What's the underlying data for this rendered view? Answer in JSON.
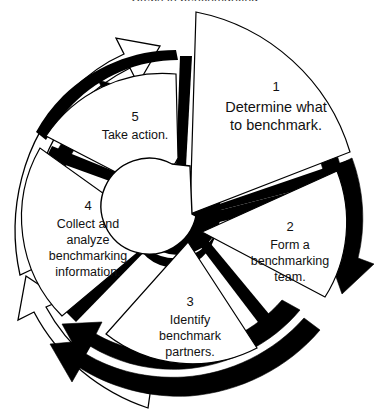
{
  "figure": {
    "kind": "process-cycle-wheel",
    "clipped_top_caption": "Steps in benchmarking",
    "background_color": "#ffffff",
    "ink_color": "#000000",
    "text_color": "#111111",
    "rotation_direction": "counterclockwise",
    "segment_count": 5
  },
  "segments": [
    {
      "number": "1",
      "lines": [
        "Determine what",
        "to benchmark."
      ],
      "emphasis": "large",
      "position": "top-right",
      "exploded": true
    },
    {
      "number": "2",
      "lines": [
        "Form a",
        "benchmarking",
        "team."
      ],
      "emphasis": "normal",
      "position": "right",
      "exploded": false
    },
    {
      "number": "3",
      "lines": [
        "Identify",
        "benchmark",
        "partners."
      ],
      "emphasis": "normal",
      "position": "bottom",
      "exploded": false
    },
    {
      "number": "4",
      "lines": [
        "Collect and",
        "analyze",
        "benchmarking",
        "information."
      ],
      "emphasis": "normal",
      "position": "left",
      "exploded": false
    },
    {
      "number": "5",
      "lines": [
        "Take action."
      ],
      "emphasis": "normal",
      "position": "top-left",
      "exploded": false
    }
  ],
  "arrows": [
    {
      "id": "outer-left-arrow",
      "style": "outline",
      "direction": "counterclockwise",
      "location": "upper-left"
    },
    {
      "id": "outer-bottom-arrow",
      "style": "outline",
      "direction": "counterclockwise",
      "location": "lower-left"
    },
    {
      "id": "solid-left-arrow",
      "style": "solid",
      "direction": "counterclockwise",
      "location": "left"
    },
    {
      "id": "solid-bottom-arrow",
      "style": "solid",
      "direction": "counterclockwise",
      "location": "bottom"
    },
    {
      "id": "solid-right-arrow-inner",
      "style": "solid",
      "direction": "clockwise-descending",
      "location": "right"
    },
    {
      "id": "solid-right-arrow-outer",
      "style": "solid",
      "direction": "clockwise-descending",
      "location": "right-outer"
    }
  ]
}
